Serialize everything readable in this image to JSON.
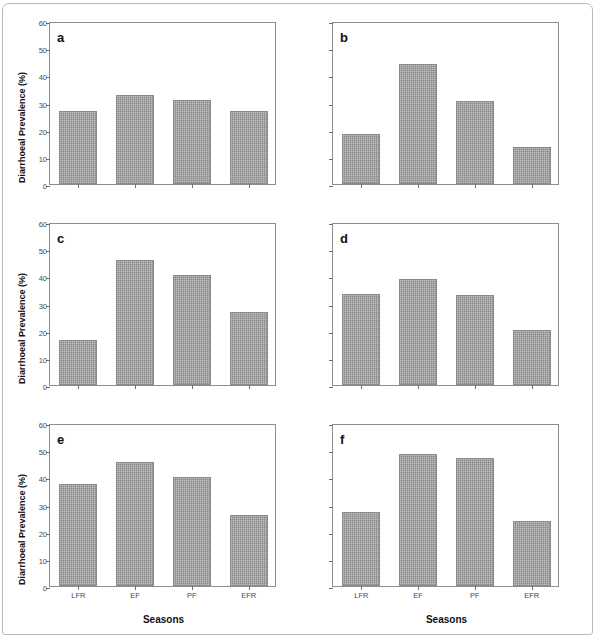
{
  "figure": {
    "ylabel": "Diarrhoeal Prevalence (%)",
    "xlabel": "Seasons",
    "y_ticks": [
      "0",
      "10",
      "20",
      "30",
      "40",
      "50",
      "60"
    ],
    "colors": {
      "bar_fill": "#c2c2c2",
      "bar_stroke": "#8a8a8a",
      "axis": "#8e8e8e",
      "text": "#111111",
      "tick_text": "#4a4a4a"
    }
  },
  "chart_data": [
    {
      "type": "bar",
      "title": "a",
      "categories": [
        "LFR",
        "EF",
        "PF",
        "EFR"
      ],
      "values": [
        26.7,
        32.7,
        30.8,
        26.8
      ],
      "xlabel": "Seasons",
      "ylabel": "Diarrhoeal Prevalence (%)",
      "ylim": [
        0,
        60
      ],
      "yticks": [
        0,
        10,
        20,
        30,
        40,
        50,
        60
      ],
      "grid": false,
      "legend": "none"
    },
    {
      "type": "bar",
      "title": "b",
      "categories": [
        "LFR",
        "EF",
        "PF",
        "EFR"
      ],
      "values": [
        18.3,
        44.0,
        30.4,
        13.8
      ],
      "xlabel": "Seasons",
      "ylabel": "Diarrhoeal Prevalence (%)",
      "ylim": [
        0,
        60
      ],
      "yticks": [
        0,
        10,
        20,
        30,
        40,
        50,
        60
      ],
      "grid": false,
      "legend": "none"
    },
    {
      "type": "bar",
      "title": "c",
      "categories": [
        "LFR",
        "EF",
        "PF",
        "EFR"
      ],
      "values": [
        16.7,
        46.2,
        40.5,
        27.0
      ],
      "xlabel": "Seasons",
      "ylabel": "Diarrhoeal Prevalence (%)",
      "ylim": [
        0,
        60
      ],
      "yticks": [
        0,
        10,
        20,
        30,
        40,
        50,
        60
      ],
      "grid": false,
      "legend": "none"
    },
    {
      "type": "bar",
      "title": "d",
      "categories": [
        "LFR",
        "EF",
        "PF",
        "EFR"
      ],
      "values": [
        33.6,
        39.0,
        33.1,
        20.4
      ],
      "xlabel": "Seasons",
      "ylabel": "Diarrhoeal Prevalence (%)",
      "ylim": [
        0,
        60
      ],
      "yticks": [
        0,
        10,
        20,
        30,
        40,
        50,
        60
      ],
      "grid": false,
      "legend": "none"
    },
    {
      "type": "bar",
      "title": "e",
      "categories": [
        "LFR",
        "EF",
        "PF",
        "EFR"
      ],
      "values": [
        37.6,
        45.6,
        40.2,
        26.3
      ],
      "xlabel": "Seasons",
      "ylabel": "Diarrhoeal Prevalence (%)",
      "ylim": [
        0,
        60
      ],
      "yticks": [
        0,
        10,
        20,
        30,
        40,
        50,
        60
      ],
      "grid": false,
      "legend": "none"
    },
    {
      "type": "bar",
      "title": "f",
      "categories": [
        "LFR",
        "EF",
        "PF",
        "EFR"
      ],
      "values": [
        27.3,
        48.6,
        47.2,
        23.9
      ],
      "xlabel": "Seasons",
      "ylabel": "Diarrhoeal Prevalence (%)",
      "ylim": [
        0,
        60
      ],
      "yticks": [
        0,
        10,
        20,
        30,
        40,
        50,
        60
      ],
      "grid": false,
      "legend": "none"
    }
  ]
}
